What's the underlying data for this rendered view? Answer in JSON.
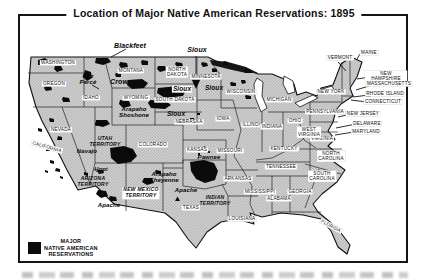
{
  "title": "Location of Major Native American Reservations: 1895",
  "legend": {
    "label": "MAJOR\nNATIVE AMERICAN\nRESERVATIONS",
    "swatch_color": "#0b0b0b"
  },
  "colors": {
    "background": "#ffffff",
    "frame": "#151515",
    "land_halftone_light": "#d2d2d2",
    "land_halftone_dark": "#b9b9b9",
    "border_lines": "#222222",
    "reservation_fill": "#0b0b0b",
    "lake_fill": "#ffffff",
    "lake_superior_fill": "#161616"
  },
  "map": {
    "states": [
      {
        "label": "WASHINGTON",
        "x": 58,
        "y": 63
      },
      {
        "label": "OREGON",
        "x": 54,
        "y": 84
      },
      {
        "label": "IDAHO",
        "x": 91,
        "y": 98
      },
      {
        "label": "MONTANA",
        "x": 131,
        "y": 71
      },
      {
        "label": "WYOMING",
        "x": 136,
        "y": 98
      },
      {
        "label": "NEVADA",
        "x": 61,
        "y": 130
      },
      {
        "label": "CALIFORNIA",
        "x": 47,
        "y": 147,
        "rot": 16
      },
      {
        "label": "UTAH\nTERRITORY",
        "x": 105,
        "y": 142,
        "italic": true,
        "boxed": false
      },
      {
        "label": "COLORADO",
        "x": 153,
        "y": 145
      },
      {
        "label": "ARIZONA\nTERRITORY",
        "x": 93,
        "y": 182,
        "italic": true,
        "boxed": false
      },
      {
        "label": "NEW MEXICO\nTERRITORY",
        "x": 141,
        "y": 193,
        "italic": true
      },
      {
        "label": "INDIAN\nTERRITORY",
        "x": 215,
        "y": 201,
        "italic": true,
        "boxed": false
      },
      {
        "label": "NORTH\nDAKOTA",
        "x": 177,
        "y": 72
      },
      {
        "label": "SOUTH DAKOTA",
        "x": 175,
        "y": 100
      },
      {
        "label": "NEBRASKA",
        "x": 189,
        "y": 122
      },
      {
        "label": "KANSAS",
        "x": 197,
        "y": 150
      },
      {
        "label": "TEXAS",
        "x": 191,
        "y": 208
      },
      {
        "label": "MINNESOTA",
        "x": 206,
        "y": 77
      },
      {
        "label": "IOWA",
        "x": 223,
        "y": 119
      },
      {
        "label": "MISSOURI",
        "x": 230,
        "y": 151
      },
      {
        "label": "ARKANSAS",
        "x": 238,
        "y": 179
      },
      {
        "label": "LOUISIANA",
        "x": 242,
        "y": 219
      },
      {
        "label": "WISCONSIN",
        "x": 241,
        "y": 92
      },
      {
        "label": "ILLINOIS",
        "x": 253,
        "y": 125
      },
      {
        "label": "INDIANA",
        "x": 272,
        "y": 127
      },
      {
        "label": "MICHIGAN",
        "x": 279,
        "y": 100
      },
      {
        "label": "OHIO",
        "x": 295,
        "y": 121
      },
      {
        "label": "KENTUCKY",
        "x": 284,
        "y": 149
      },
      {
        "label": "TENNESSEE",
        "x": 281,
        "y": 167
      },
      {
        "label": "MISSISSIPPI",
        "x": 260,
        "y": 192
      },
      {
        "label": "ALABAMA",
        "x": 279,
        "y": 199
      },
      {
        "label": "GEORGIA",
        "x": 300,
        "y": 192
      },
      {
        "label": "FLORIDA",
        "x": 331,
        "y": 226,
        "rot": 28
      },
      {
        "label": "SOUTH\nCAROLINA",
        "x": 322,
        "y": 176
      },
      {
        "label": "NORTH\nCAROLINA",
        "x": 331,
        "y": 156
      },
      {
        "label": "VIRGINIA",
        "x": 322,
        "y": 139
      },
      {
        "label": "WEST\nVIRGINIA",
        "x": 309,
        "y": 132
      },
      {
        "label": "PENNSYLVANIA",
        "x": 325,
        "y": 112
      },
      {
        "label": "NEW YORK",
        "x": 331,
        "y": 92
      },
      {
        "label": "VERMONT",
        "x": 340,
        "y": 58
      },
      {
        "label": "MAINE",
        "x": 369,
        "y": 53
      },
      {
        "label": "NEW HAMPSHIRE",
        "x": 386,
        "y": 76
      },
      {
        "label": "MASSACHUSETTS",
        "x": 389,
        "y": 84
      },
      {
        "label": "RHODE ISLAND",
        "x": 385,
        "y": 94
      },
      {
        "label": "CONNECTICUT",
        "x": 383,
        "y": 102
      },
      {
        "label": "NEW JERSEY",
        "x": 363,
        "y": 114
      },
      {
        "label": "DELAWARE",
        "x": 367,
        "y": 124
      },
      {
        "label": "MARYLAND",
        "x": 366,
        "y": 132
      }
    ],
    "reservations": [
      {
        "label": "Blackfeet",
        "x": 130,
        "y": 46,
        "size": 7
      },
      {
        "label": "Sioux",
        "x": 197,
        "y": 50,
        "size": 7
      },
      {
        "label": "Nez\nPercé",
        "x": 88,
        "y": 79
      },
      {
        "label": "Crow",
        "x": 119,
        "y": 82,
        "size": 7
      },
      {
        "label": "Arapaho\nShoshone",
        "x": 134,
        "y": 112
      },
      {
        "label": "Sioux",
        "x": 182,
        "y": 89,
        "size": 6.5,
        "boxed": true
      },
      {
        "label": "Sioux",
        "x": 214,
        "y": 88,
        "size": 6.5
      },
      {
        "label": "Sioux",
        "x": 176,
        "y": 114,
        "size": 6.5
      },
      {
        "label": "Ute",
        "x": 100,
        "y": 124
      },
      {
        "label": "Ute",
        "x": 129,
        "y": 152
      },
      {
        "label": "Navajo",
        "x": 87,
        "y": 151
      },
      {
        "label": "Hopi",
        "x": 101,
        "y": 169
      },
      {
        "label": "Apache",
        "x": 109,
        "y": 205
      },
      {
        "label": "Apache",
        "x": 186,
        "y": 190
      },
      {
        "label": "Arapaho\nCheyenne",
        "x": 164,
        "y": 177
      },
      {
        "label": "Pawnee",
        "x": 209,
        "y": 157
      }
    ]
  }
}
